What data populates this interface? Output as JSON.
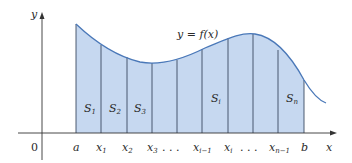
{
  "diagram": {
    "curve_label": "y = f(x)",
    "axes": {
      "x_label": "x",
      "y_label": "y",
      "origin_label": "0"
    },
    "colors": {
      "fill": "#c6d8f0",
      "curve": "#4a78b8",
      "axis": "#333333",
      "divider": "#3a4a60"
    },
    "tick_labels": [
      {
        "id": "a",
        "text": "a",
        "sub": ""
      },
      {
        "id": "x1",
        "text": "x",
        "sub": "1"
      },
      {
        "id": "x2",
        "text": "x",
        "sub": "2"
      },
      {
        "id": "x3",
        "text": "x",
        "sub": "3"
      },
      {
        "id": "dots1",
        "text": ". . .",
        "sub": ""
      },
      {
        "id": "xim1",
        "text": "x",
        "sub": "i−1"
      },
      {
        "id": "xi",
        "text": "x",
        "sub": "i"
      },
      {
        "id": "dots2",
        "text": ". . .",
        "sub": ""
      },
      {
        "id": "xnm1",
        "text": "x",
        "sub": "n−1"
      },
      {
        "id": "b",
        "text": "b",
        "sub": ""
      }
    ],
    "strip_labels": [
      {
        "id": "S1",
        "text": "S",
        "sub": "1"
      },
      {
        "id": "S2",
        "text": "S",
        "sub": "2"
      },
      {
        "id": "S3",
        "text": "S",
        "sub": "3"
      },
      {
        "id": "Si",
        "text": "S",
        "sub": "i"
      },
      {
        "id": "Sn",
        "text": "S",
        "sub": "n"
      }
    ]
  }
}
